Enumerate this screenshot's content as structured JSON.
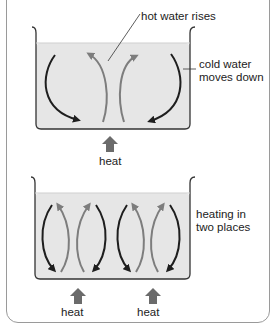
{
  "diagram": {
    "type": "convection currents illustration",
    "top_panel": {
      "labels": {
        "hot_water": "hot water rises",
        "cold_water_line1": "cold water",
        "cold_water_line2": "moves down",
        "heat": "heat"
      },
      "heat_sources": 1
    },
    "bottom_panel": {
      "labels": {
        "heating_line1": "heating in",
        "heating_line2": "two places",
        "heat_left": "heat",
        "heat_right": "heat"
      },
      "heat_sources": 2
    },
    "colors": {
      "water": "#e6e6e6",
      "hot_arrow": "#7d7d7d",
      "cold_arrow": "#1e1e1e",
      "heat_arrow": "#6b6b6b",
      "beaker_outline": "#333333",
      "frame": "#9a9a9a"
    }
  }
}
